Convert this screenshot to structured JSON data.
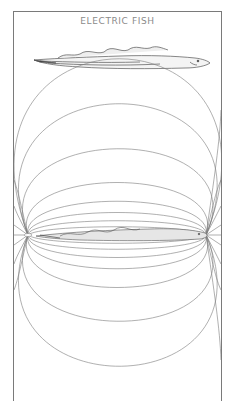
{
  "figure": {
    "title": "ELECTRIC FISH",
    "line_color": "#6e6e6e",
    "frame_color": "#7a7a7a",
    "background": "#ffffff",
    "panels": [
      {
        "name": "fish-side-view",
        "description": "Eel-like electric fish with undulating dorsal fin"
      },
      {
        "name": "electric-field-diagram",
        "description": "Dipole field lines around the fish, tail pole at left, head pole at right"
      }
    ]
  }
}
